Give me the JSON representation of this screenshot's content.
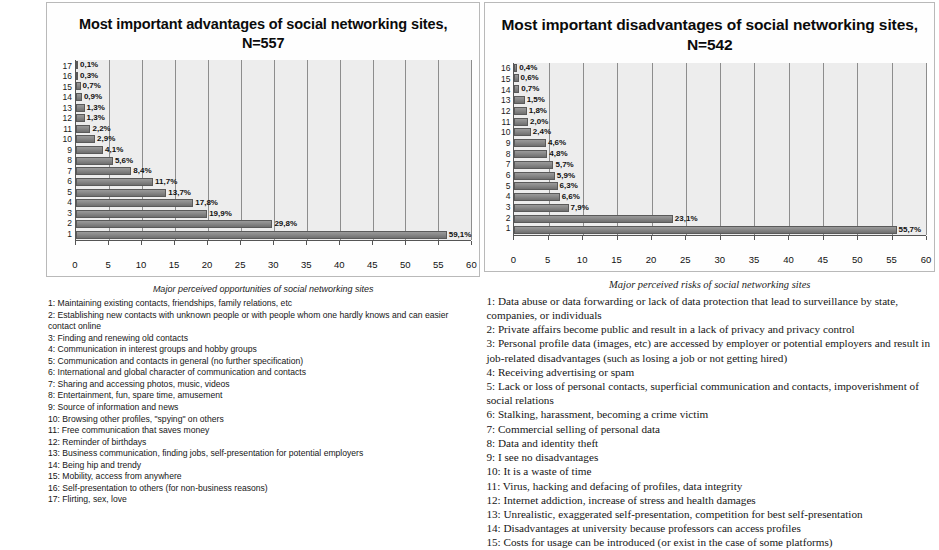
{
  "chart_data": [
    {
      "type": "bar",
      "orientation": "horizontal",
      "title": "Most important advantages of social networking sites, N=557",
      "caption": "Major perceived opportunities of social networking sites",
      "xlabel": "",
      "ylabel": "",
      "xlim": [
        0,
        60
      ],
      "xticks": [
        0,
        5,
        10,
        15,
        20,
        25,
        30,
        35,
        40,
        45,
        50,
        55,
        60
      ],
      "grid": true,
      "categories": [
        "1",
        "2",
        "3",
        "4",
        "5",
        "6",
        "7",
        "8",
        "9",
        "10",
        "11",
        "12",
        "13",
        "14",
        "15",
        "16",
        "17"
      ],
      "values": [
        59.1,
        29.8,
        19.9,
        17.8,
        13.7,
        11.7,
        8.4,
        5.6,
        4.1,
        2.9,
        2.2,
        1.3,
        1.3,
        0.9,
        0.7,
        0.3,
        0.1
      ],
      "value_labels": [
        "59,1%",
        "29,8%",
        "19,9%",
        "17,8%",
        "13,7%",
        "11,7%",
        "8,4%",
        "5,6%",
        "4,1%",
        "2,9%",
        "2,2%",
        "1,3%",
        "1,3%",
        "0,9%",
        "0,7%",
        "0,3%",
        "0,1%"
      ],
      "legend": [
        "1: Maintaining existing contacts, friendships, family relations, etc",
        "2: Establishing new contacts with unknown people or with people whom one hardly knows and can easier contact online",
        "3: Finding and renewing old contacts",
        "4: Communication in interest groups and hobby groups",
        "5: Communication and contacts in general (no further specification)",
        "6: International and global character of communication and contacts",
        "7: Sharing and accessing photos, music, videos",
        "8: Entertainment, fun, spare time, amusement",
        "9: Source of information and news",
        "10: Browsing other profiles, \"spying\" on others",
        "11: Free communication that saves money",
        "12: Reminder of birthdays",
        "13: Business communication, finding jobs, self-presentation for potential employers",
        "14: Being hip and trendy",
        "15: Mobility, access from anywhere",
        "16: Self-presentation to others (for non-business reasons)",
        "17: Flirting, sex, love"
      ]
    },
    {
      "type": "bar",
      "orientation": "horizontal",
      "title": "Most important disadvantages of social networking sites, N=542",
      "caption": "Major perceived risks of social networking sites",
      "xlabel": "",
      "ylabel": "",
      "xlim": [
        0,
        60
      ],
      "xticks": [
        0,
        5,
        10,
        15,
        20,
        25,
        30,
        35,
        40,
        45,
        50,
        55,
        60
      ],
      "grid": true,
      "categories": [
        "1",
        "2",
        "3",
        "4",
        "5",
        "6",
        "7",
        "8",
        "9",
        "10",
        "11",
        "12",
        "13",
        "14",
        "15",
        "16"
      ],
      "values": [
        55.7,
        23.1,
        7.9,
        6.6,
        6.3,
        5.9,
        5.7,
        4.8,
        4.6,
        2.4,
        2.0,
        1.8,
        1.5,
        0.7,
        0.6,
        0.4
      ],
      "value_labels": [
        "55,7%",
        "23,1%",
        "7,9%",
        "6,6%",
        "6,3%",
        "5,9%",
        "5,7%",
        "4,8%",
        "4,6%",
        "2,4%",
        "2,0%",
        "1,8%",
        "1,5%",
        "0,7%",
        "0,6%",
        "0,4%"
      ],
      "legend": [
        "1: Data abuse or data forwarding or lack of data protection that lead to surveillance by state, companies, or individuals",
        "2: Private affairs become public and result in a lack of privacy and privacy control",
        "3: Personal profile data (images, etc) are accessed by employer or potential employers and result in job-related disadvantages (such as losing a job or not getting hired)",
        "4: Receiving advertising or spam",
        "5: Lack or loss of personal contacts, superficial communication and contacts, impoverishment of social relations",
        "6: Stalking, harassment, becoming a crime victim",
        "7: Commercial selling of personal data",
        "8: Data and identity theft",
        "9: I see no disadvantages",
        "10: It is a waste of time",
        "11: Virus, hacking and defacing of profiles, data integrity",
        "12: Internet addiction, increase of stress and health damages",
        "13: Unrealistic, exaggerated self-presentation, competition for best self-presentation",
        "14: Disadvantages at university because professors can access profiles",
        "15: Costs for usage can be introduced (or exist in the case of some platforms)"
      ]
    }
  ],
  "colors": {
    "bar_fill": "#8a8a8a",
    "bar_edge": "#5a5a5a",
    "plot_background": "#ededed",
    "gridline": "#8d8d8d",
    "frame_border": "#b9b9b9"
  }
}
